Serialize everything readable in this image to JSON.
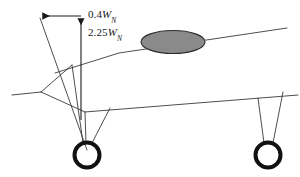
{
  "figure": {
    "name": "aircraft-landing-gear-dimension-diagram",
    "kind": "engineering-line-drawing",
    "width": 300,
    "height": 177,
    "background_color": "#ffffff"
  },
  "labels": {
    "upper": {
      "text": "0.4W_N",
      "coefficient": "0.4",
      "symbol": "W",
      "subscript": "N",
      "icon": "dimension-label"
    },
    "lower": {
      "text": "2.25W_N",
      "coefficient": "2.25",
      "symbol": "W",
      "subscript": "N",
      "icon": "dimension-label"
    }
  },
  "annotations": {
    "horizontal_arrow": {
      "name": "horizontal-dimension-arrow",
      "direction": "left",
      "from_x": 81,
      "from_y": 16,
      "to_x": 40,
      "to_y": 16
    },
    "vertical_arrow": {
      "name": "vertical-dimension-arrow",
      "direction": "up",
      "from_x": 81,
      "from_y": 120,
      "to_x": 81,
      "to_y": 16
    },
    "diagonal_leader": {
      "name": "diagonal-leader-line",
      "from_x": 40,
      "from_y": 18,
      "to_x": 87,
      "to_y": 150
    }
  },
  "geometry": {
    "fuselage_pod": {
      "name": "fuselage-pod-ellipse",
      "cx": 173,
      "cy": 42,
      "rx": 32,
      "ry": 11.5,
      "fill": "#8a8a8a",
      "stroke": "#2b2b2b"
    },
    "wheels": [
      {
        "name": "main-wheel-left",
        "cx": 87,
        "cy": 155,
        "r": 12.5,
        "stroke_width": 4,
        "stroke": "#111111"
      },
      {
        "name": "main-wheel-right",
        "cx": 268,
        "cy": 155,
        "r": 12.5,
        "stroke_width": 4,
        "stroke": "#111111"
      }
    ],
    "strokes": {
      "thin": 0.9,
      "body": 1.0,
      "color": "#3a3a3a"
    }
  },
  "lines": {
    "upper_wing": {
      "name": "upper-wing-line",
      "points": "55,73 119,53 287,28"
    },
    "nose_boom": {
      "name": "nose-boom-line",
      "points": "12,95 41,92"
    },
    "fork_upper": {
      "name": "nose-fork-upper-line",
      "points": "41,92 72,65"
    },
    "fork_lower": {
      "name": "nose-fork-lower-line",
      "points": "41,92 85,112"
    },
    "lower_body": {
      "name": "lower-body-line",
      "points": "85,112 298,95"
    },
    "gear_left_outer": {
      "name": "left-gear-leg-outer",
      "points": "72,65 83,143"
    },
    "gear_left_inner": {
      "name": "left-gear-leg-inner",
      "points": "85,112 86,143"
    },
    "gear_left_rear": {
      "name": "left-gear-leg-rear",
      "points": "110,108 92,143"
    },
    "gear_right_front": {
      "name": "right-gear-leg-front",
      "points": "258,98 264,143"
    },
    "gear_right_rear": {
      "name": "right-gear-leg-rear",
      "points": "283,92 273,143"
    }
  }
}
